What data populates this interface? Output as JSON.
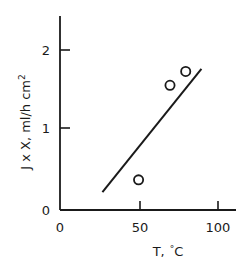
{
  "chart_data": {
    "type": "scatter",
    "title": "",
    "subtitle": "",
    "xlabel": "T, °C",
    "ylabel": "J x X, ml/h cm²",
    "ylabel_parts": {
      "main": "J x X, ml/h cm",
      "superscript": "2"
    },
    "xlabel_parts": {
      "variable": "T,",
      "degree": "°",
      "unit": "C"
    },
    "xlim": [
      0,
      112
    ],
    "ylim": [
      0,
      2.38
    ],
    "xticks": [
      0,
      50,
      100
    ],
    "xticklabels": [
      "0",
      "50",
      "100"
    ],
    "yticks": [
      0,
      1,
      2
    ],
    "yticklabels": [
      "0",
      "1",
      "2"
    ],
    "grid": false,
    "legend": false,
    "legend_position": "none",
    "marker": "open-circle",
    "series": [
      {
        "name": "measurements",
        "x": [
          50,
          70,
          80
        ],
        "y": [
          0.37,
          1.53,
          1.7
        ]
      }
    ],
    "fit_line": {
      "name": "linear-fit",
      "x": [
        27,
        90
      ],
      "y": [
        0.22,
        1.73
      ]
    },
    "colors": {
      "axis": "#1a1a1a",
      "marker": "#1a1a1a",
      "line": "#1a1a1a",
      "background": "#ffffff"
    }
  },
  "geometry": {
    "axis_origin_x": 60,
    "axis_origin_y": 210,
    "axis_top_y": 16,
    "axis_right_x": 236
  }
}
